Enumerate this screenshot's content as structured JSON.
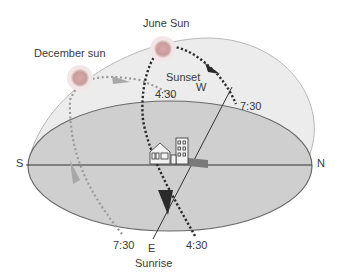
{
  "diagram": {
    "labels": {
      "june_sun": "June Sun",
      "december_sun": "December sun",
      "sunset": "Sunset",
      "sunrise": "Sunrise",
      "west": "W",
      "east": "E",
      "south": "S",
      "north": "N",
      "december_sunset_time": "4:30",
      "june_sunset_time": "7:30",
      "december_sunrise_time": "7:30",
      "june_sunrise_time": "4:30"
    },
    "icons": {
      "june_sun": "sun-icon",
      "december_sun": "sun-icon",
      "observer": "house-and-building-icon"
    },
    "colors": {
      "dome": "#e8e8e8",
      "ground": "#c9c9c9",
      "outline": "#6a6a6a",
      "june_path": "#2a2a2a",
      "december_path": "#9a9a9a",
      "sun": "#d0a6a6",
      "text": "#3a3a3a"
    }
  }
}
